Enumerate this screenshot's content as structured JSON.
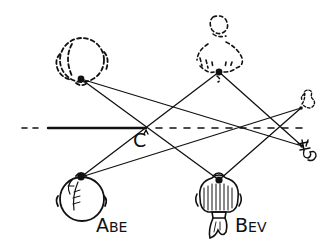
{
  "diagram": {
    "labels": {
      "point_c": "C",
      "abe_first": "A",
      "abe_rest": "BE",
      "bev_first": "B",
      "bev_rest": "EV"
    },
    "figures": [
      {
        "name": "Abe",
        "kind": "real",
        "style": "solid"
      },
      {
        "name": "Bev",
        "kind": "real",
        "style": "solid"
      },
      {
        "name": "Abe",
        "kind": "reflected-image",
        "style": "dashed"
      },
      {
        "name": "Bev",
        "kind": "reflected-image",
        "style": "dashed"
      },
      {
        "name": "small figure",
        "kind": "real-and-reflected",
        "style": "mixed"
      }
    ],
    "mirror": {
      "description": "horizontal mirror line, solid segment with dashed extensions"
    },
    "colors": {
      "ink": "#111111",
      "background": "#ffffff"
    }
  }
}
